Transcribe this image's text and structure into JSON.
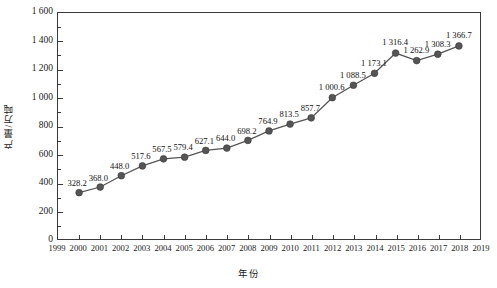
{
  "chart_data": {
    "type": "line",
    "title": "",
    "xlabel": "年份",
    "ylabel": "产量/万吨",
    "xlim": [
      1999,
      2019
    ],
    "ylim": [
      0,
      1600
    ],
    "grid": false,
    "legend": null,
    "series_color": "#555555",
    "x": [
      2000,
      2001,
      2002,
      2003,
      2004,
      2005,
      2006,
      2007,
      2008,
      2009,
      2010,
      2011,
      2012,
      2013,
      2014,
      2015,
      2016,
      2017,
      2018
    ],
    "values": [
      328.2,
      368.0,
      448.0,
      517.6,
      567.5,
      579.4,
      627.1,
      644.0,
      698.2,
      764.9,
      813.5,
      857.7,
      1000.6,
      1088.5,
      1173.1,
      1316.4,
      1262.9,
      1308.3,
      1366.7
    ],
    "point_labels": [
      "328.2",
      "368.0",
      "448.0",
      "517.6",
      "567.5",
      "579.4",
      "627.1",
      "644.0",
      "698.2",
      "764.9",
      "813.5",
      "857.7",
      "1 000.6",
      "1 088.5",
      "1 173.1",
      "1 316.4",
      "1 262.9",
      "1 308.3",
      "1 366.7"
    ],
    "x_tick_labels": [
      "1999",
      "2000",
      "2001",
      "2002",
      "2003",
      "2004",
      "2005",
      "2006",
      "2007",
      "2008",
      "2009",
      "2010",
      "2011",
      "2012",
      "2013",
      "2014",
      "2015",
      "2016",
      "2017",
      "2018",
      "2019"
    ],
    "y_tick_labels": [
      "0",
      "200",
      "400",
      "600",
      "800",
      "1 000",
      "1 200",
      "1 400",
      "1 600"
    ],
    "y_tick_values": [
      0,
      200,
      400,
      600,
      800,
      1000,
      1200,
      1400,
      1600
    ],
    "y_minor_tick_values": [
      100,
      300,
      500,
      700,
      900,
      1100,
      1300,
      1500
    ]
  }
}
